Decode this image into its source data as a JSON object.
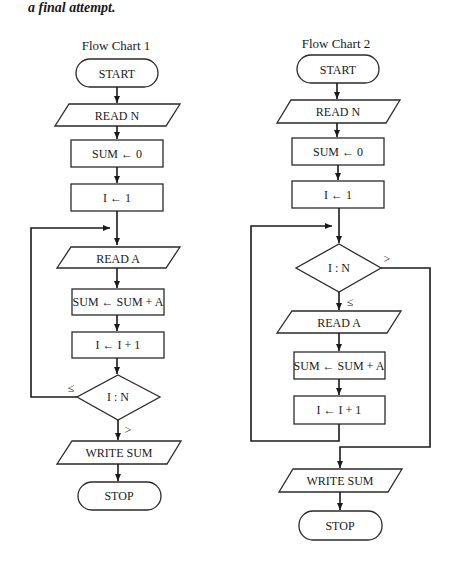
{
  "caption": "a final attempt.",
  "flowchart1": {
    "title": "Flow Chart 1",
    "nodes": {
      "start": "START",
      "read_n": "READ N",
      "sum_init": "SUM ← 0",
      "i_init": "I ← 1",
      "read_a": "READ A",
      "sum_add": "SUM ← SUM + A",
      "i_inc": "I ← I + 1",
      "decision": "I : N",
      "write_sum": "WRITE SUM",
      "stop": "STOP"
    },
    "edge_labels": {
      "loop_back": "≤",
      "exit": ">"
    }
  },
  "flowchart2": {
    "title": "Flow Chart 2",
    "nodes": {
      "start": "START",
      "read_n": "READ N",
      "sum_init": "SUM ← 0",
      "i_init": "I ← 1",
      "decision": "I : N",
      "read_a": "READ A",
      "sum_add": "SUM ← SUM + A",
      "i_inc": "I ← I + 1",
      "write_sum": "WRITE SUM",
      "stop": "STOP"
    },
    "edge_labels": {
      "continue": "≤",
      "exit": ">"
    }
  }
}
